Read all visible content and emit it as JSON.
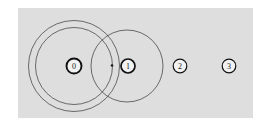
{
  "figure": {
    "background_color": "#ffffff",
    "panel": {
      "name": "plot-panel",
      "fill": "#dedede",
      "x": 18,
      "y": 8,
      "width": 235,
      "height": 110
    },
    "colors": {
      "node_stroke": "#111111",
      "node_fill": "#f2f2f2",
      "circle_stroke": "#4a4a4a",
      "label_text": "#1c1c1c",
      "panel_fill": "#dedede",
      "point_marker": "#1c1c1c"
    },
    "nodes": [
      {
        "label": "0",
        "cx": 74,
        "cy": 66,
        "r": 7.5,
        "stroke_width": 1.9
      },
      {
        "label": "1",
        "cx": 128,
        "cy": 66,
        "r": 7.0,
        "stroke_width": 1.7
      },
      {
        "label": "2",
        "cx": 180,
        "cy": 66,
        "r": 6.8,
        "stroke_width": 1.2
      },
      {
        "label": "3",
        "cx": 229,
        "cy": 66,
        "r": 6.8,
        "stroke_width": 1.2
      }
    ],
    "circles": [
      {
        "name": "outer-circle-node-0",
        "cx": 74,
        "cy": 66,
        "r": 45.5,
        "stroke_width": 0.8
      },
      {
        "name": "inner-circle-node-0",
        "cx": 74,
        "cy": 66,
        "r": 38.5,
        "stroke_width": 0.8
      },
      {
        "name": "circle-node-1",
        "cx": 127,
        "cy": 66,
        "r": 36.0,
        "stroke_width": 0.8
      }
    ],
    "point_markers": [
      {
        "name": "point-marker-left-of-node-1",
        "cx": 112,
        "cy": 65.5,
        "r": 1.3
      }
    ]
  }
}
